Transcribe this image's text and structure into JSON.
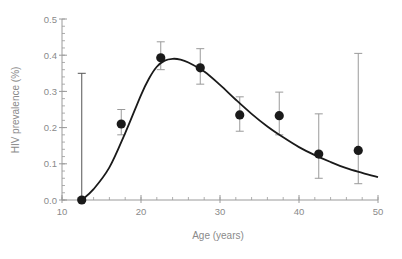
{
  "chart_data": {
    "type": "scatter",
    "title": "",
    "xlabel": "Age (years)",
    "ylabel": "HIV prevalence (%)",
    "xlim": [
      10,
      50
    ],
    "ylim": [
      0.0,
      0.5
    ],
    "x_ticks": [
      10,
      20,
      30,
      40,
      50
    ],
    "x_tick_labels": [
      "10",
      "20",
      "30",
      "40",
      "50"
    ],
    "x_minor_step": 2,
    "y_ticks": [
      0.0,
      0.1,
      0.2,
      0.3,
      0.4,
      0.5
    ],
    "y_tick_labels": [
      "0.0",
      "0.1",
      "0.2",
      "0.3",
      "0.4",
      "0.5"
    ],
    "y_minor_step": 0.02,
    "grid": false,
    "legend": null,
    "series": [
      {
        "name": "Observed prevalence",
        "kind": "points_with_error_bars",
        "color": "#1a1a1a",
        "errorbar_color": "#9a9a9a",
        "points": [
          {
            "x": 12.5,
            "y": 0.0,
            "lo": 0.0,
            "hi": 0.35
          },
          {
            "x": 17.5,
            "y": 0.21,
            "lo": 0.18,
            "hi": 0.25
          },
          {
            "x": 22.5,
            "y": 0.393,
            "lo": 0.36,
            "hi": 0.437
          },
          {
            "x": 27.5,
            "y": 0.365,
            "lo": 0.32,
            "hi": 0.418
          },
          {
            "x": 32.5,
            "y": 0.235,
            "lo": 0.19,
            "hi": 0.285
          },
          {
            "x": 37.5,
            "y": 0.233,
            "lo": 0.18,
            "hi": 0.298
          },
          {
            "x": 42.5,
            "y": 0.127,
            "lo": 0.06,
            "hi": 0.238
          },
          {
            "x": 47.5,
            "y": 0.137,
            "lo": 0.045,
            "hi": 0.405
          }
        ]
      },
      {
        "name": "Fitted curve",
        "kind": "line",
        "color": "#1a1a1a",
        "x": [
          12.5,
          14,
          16,
          18,
          20,
          21,
          22,
          23,
          24,
          25,
          26,
          28,
          30,
          32,
          34,
          36,
          38,
          40,
          42,
          44,
          46,
          48,
          50
        ],
        "y": [
          0.0,
          0.03,
          0.09,
          0.185,
          0.29,
          0.335,
          0.368,
          0.385,
          0.39,
          0.388,
          0.38,
          0.355,
          0.318,
          0.277,
          0.238,
          0.203,
          0.173,
          0.146,
          0.124,
          0.105,
          0.088,
          0.075,
          0.063
        ]
      }
    ]
  }
}
